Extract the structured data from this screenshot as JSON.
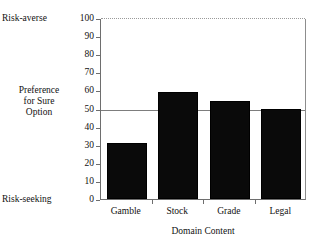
{
  "chart_data": {
    "type": "bar",
    "title": "",
    "subtitle": "",
    "xlabel": "Domain Content",
    "ylabel": "Preference for Sure Option",
    "categories": [
      "Gamble",
      "Stock",
      "Grade",
      "Legal"
    ],
    "values": [
      31,
      59,
      54,
      50
    ],
    "series": [
      {
        "name": "Preference for Sure Option",
        "values": [
          31,
          59,
          54,
          50
        ]
      }
    ],
    "ylim": [
      0,
      100
    ],
    "yticks": [
      0,
      10,
      20,
      30,
      40,
      50,
      60,
      70,
      80,
      90,
      100
    ],
    "ytick_labels": [
      "0",
      "10",
      "20",
      "30",
      "40",
      "50",
      "60",
      "70",
      "80",
      "90",
      "100"
    ],
    "grid": false,
    "legend": null,
    "legend_position": "none",
    "reference_line": {
      "value": 50,
      "label": "",
      "style": "solid"
    },
    "annotations": [
      {
        "text": "Risk-averse",
        "anchor_value": 100,
        "position": "left-top"
      },
      {
        "text": "Risk-seeking",
        "anchor_value": 0,
        "position": "left-bottom"
      }
    ],
    "bar_color": "#0a0a0a",
    "axis_color": "#6e6e6e",
    "reference_line_color": "#7d7d7d"
  },
  "axes": {
    "y_title_lines": [
      "Preference",
      "for Sure",
      "Option"
    ],
    "x_title": "Domain Content",
    "top_annotation": "Risk-averse",
    "bottom_annotation": "Risk-seeking"
  },
  "ticks": {
    "y": [
      "100",
      "90",
      "80",
      "70",
      "60",
      "50",
      "40",
      "30",
      "20",
      "10",
      "0"
    ],
    "x": [
      "Gamble",
      "Stock",
      "Grade",
      "Legal"
    ]
  }
}
